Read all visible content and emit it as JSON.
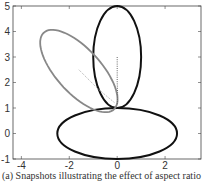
{
  "chart_data": {
    "type": "line",
    "title": "",
    "caption": "(a) Snapshots illustrating the effect of aspect ratio",
    "xlabel": "",
    "ylabel": "",
    "xlim": [
      -4.35,
      3.5
    ],
    "ylim": [
      -1,
      5
    ],
    "grid": false,
    "x_ticks": [
      -4,
      -2,
      0,
      2
    ],
    "y_ticks": [
      -1,
      0,
      1,
      2,
      3,
      4,
      5
    ],
    "series": [
      {
        "name": "horizontal ellipse",
        "shape": "ellipse",
        "cx": 0,
        "cy": 0,
        "rx": 2.5,
        "ry": 1,
        "rotation_deg": 0,
        "color": "#111111"
      },
      {
        "name": "vertical ellipse",
        "shape": "ellipse",
        "cx": 0,
        "cy": 3,
        "rx": 1,
        "ry": 2,
        "rotation_deg": 0,
        "color": "#111111"
      },
      {
        "name": "tilted ellipse",
        "shape": "ellipse",
        "cx": -1.6,
        "cy": 2.45,
        "rx": 2.1,
        "ry": 0.9,
        "rotation_deg": -45,
        "color": "#888888"
      },
      {
        "name": "vertical trajectory",
        "shape": "dotted",
        "points": [
          [
            0,
            3
          ],
          [
            0,
            2
          ],
          [
            0.02,
            1.5
          ],
          [
            0,
            1.1
          ]
        ],
        "color": "#666666"
      },
      {
        "name": "tilted trajectory",
        "shape": "dotted",
        "points": [
          [
            -1.6,
            2.5
          ],
          [
            -0.8,
            1.75
          ],
          [
            -0.1,
            1.2
          ]
        ],
        "color": "#aaaaaa"
      }
    ]
  },
  "caption": "(a) Snapshots illustrating the effect of aspect ratio"
}
